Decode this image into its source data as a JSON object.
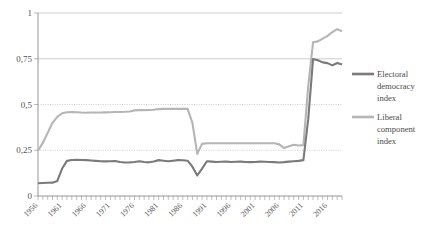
{
  "chart_data": {
    "type": "line",
    "title": "",
    "xlabel": "",
    "ylabel": "",
    "ylim": [
      0,
      1
    ],
    "xlim": [
      1956,
      2019
    ],
    "grid": true,
    "legend_position": "right",
    "y_ticks": [
      "0",
      "0,25",
      "0,5",
      "0,75",
      "1"
    ],
    "y_tick_values": [
      0,
      0.25,
      0.5,
      0.75,
      1
    ],
    "x_ticks": [
      "1956",
      "1961",
      "1966",
      "1971",
      "1976",
      "1981",
      "1986",
      "1991",
      "1996",
      "2001",
      "2006",
      "2011",
      "2016"
    ],
    "x_tick_values": [
      1956,
      1961,
      1966,
      1971,
      1976,
      1981,
      1986,
      1991,
      1996,
      2001,
      2006,
      2011,
      2016
    ],
    "x": [
      1956,
      1957,
      1958,
      1959,
      1960,
      1961,
      1962,
      1963,
      1964,
      1965,
      1966,
      1967,
      1968,
      1969,
      1970,
      1971,
      1972,
      1973,
      1974,
      1975,
      1976,
      1977,
      1978,
      1979,
      1980,
      1981,
      1982,
      1983,
      1984,
      1985,
      1986,
      1987,
      1988,
      1989,
      1990,
      1991,
      1992,
      1993,
      1994,
      1995,
      1996,
      1997,
      1998,
      1999,
      2000,
      2001,
      2002,
      2003,
      2004,
      2005,
      2006,
      2007,
      2008,
      2009,
      2010,
      2011,
      2012,
      2013,
      2014,
      2015,
      2016,
      2017,
      2018,
      2019
    ],
    "series": [
      {
        "name": "Electoral democracy index",
        "color": "#7a7a7a",
        "values": [
          0.07,
          0.071,
          0.072,
          0.073,
          0.082,
          0.15,
          0.192,
          0.197,
          0.198,
          0.197,
          0.196,
          0.194,
          0.192,
          0.19,
          0.189,
          0.19,
          0.191,
          0.186,
          0.183,
          0.184,
          0.186,
          0.19,
          0.186,
          0.184,
          0.189,
          0.196,
          0.193,
          0.19,
          0.193,
          0.196,
          0.195,
          0.193,
          0.16,
          0.112,
          0.15,
          0.19,
          0.188,
          0.186,
          0.187,
          0.188,
          0.186,
          0.187,
          0.188,
          0.186,
          0.185,
          0.186,
          0.188,
          0.187,
          0.186,
          0.185,
          0.183,
          0.185,
          0.188,
          0.19,
          0.192,
          0.196,
          0.42,
          0.748,
          0.742,
          0.73,
          0.726,
          0.714,
          0.727,
          0.718
        ]
      },
      {
        "name": "Liberal component index",
        "color": "#b5b5b5",
        "values": [
          0.248,
          0.29,
          0.345,
          0.4,
          0.432,
          0.452,
          0.458,
          0.459,
          0.458,
          0.456,
          0.455,
          0.456,
          0.456,
          0.456,
          0.457,
          0.458,
          0.459,
          0.459,
          0.46,
          0.462,
          0.468,
          0.469,
          0.469,
          0.47,
          0.471,
          0.475,
          0.476,
          0.476,
          0.476,
          0.476,
          0.476,
          0.476,
          0.4,
          0.23,
          0.285,
          0.288,
          0.288,
          0.288,
          0.288,
          0.288,
          0.288,
          0.288,
          0.288,
          0.288,
          0.288,
          0.288,
          0.288,
          0.288,
          0.288,
          0.288,
          0.282,
          0.262,
          0.272,
          0.28,
          0.276,
          0.278,
          0.6,
          0.84,
          0.845,
          0.86,
          0.875,
          0.896,
          0.912,
          0.9
        ]
      }
    ]
  },
  "legend": {
    "items": [
      {
        "label_lines": [
          "Electoral",
          "democracy",
          "index"
        ],
        "color": "#7a7a7a"
      },
      {
        "label_lines": [
          "Liberal",
          "component",
          "index"
        ],
        "color": "#b5b5b5"
      }
    ]
  },
  "legend_text": {
    "e1l1": "Electoral",
    "e1l2": "democracy",
    "e1l3": "index",
    "e2l1": "Liberal",
    "e2l2": "component",
    "e2l3": "index"
  },
  "y_axis_labels": {
    "t0": "0",
    "t1": "0,25",
    "t2": "0,5",
    "t3": "0,75",
    "t4": "1"
  },
  "x_axis_labels": {
    "t0": "1956",
    "t1": "1961",
    "t2": "1966",
    "t3": "1971",
    "t4": "1976",
    "t5": "1981",
    "t6": "1986",
    "t7": "1991",
    "t8": "1996",
    "t9": "2001",
    "t10": "2006",
    "t11": "2011",
    "t12": "2016"
  }
}
